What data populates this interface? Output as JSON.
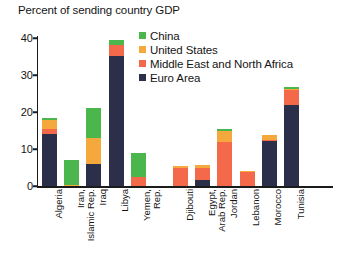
{
  "chart_data": {
    "type": "bar",
    "title": "Percent of sending country GDP",
    "xlabel": "",
    "ylabel": "",
    "ylim": [
      0,
      40
    ],
    "yticks": [
      0,
      10,
      20,
      30,
      40
    ],
    "grid": false,
    "stacked": true,
    "legend_position": "top-center",
    "categories": [
      "Algeria",
      "Iran,\nIslamic Rep.",
      "Iraq",
      "Libya",
      "Yemen,\nRep.",
      "Djibouti",
      "Egypt,\nArab Rep.",
      "Jordan",
      "Lebanon",
      "Morocco",
      "Tunisia"
    ],
    "series": [
      {
        "name": "Euro Area",
        "color": "#2c2f4a",
        "values": [
          14.0,
          0.0,
          6.0,
          35.2,
          0.0,
          0.0,
          1.6,
          0.0,
          0.0,
          12.2,
          21.8
        ]
      },
      {
        "name": "Middle East and North Africa",
        "color": "#f4694a",
        "values": [
          1.3,
          0.0,
          0.0,
          2.8,
          2.4,
          5.0,
          3.4,
          11.8,
          3.9,
          0.3,
          4.2
        ]
      },
      {
        "name": "United States",
        "color": "#f5a93c",
        "values": [
          2.6,
          0.4,
          7.0,
          0.0,
          0.0,
          0.3,
          0.8,
          3.2,
          0.2,
          1.2,
          0.3
        ]
      },
      {
        "name": "China",
        "color": "#4bb64b",
        "values": [
          0.6,
          6.7,
          8.0,
          1.6,
          6.4,
          0.0,
          0.0,
          0.5,
          0.0,
          0.0,
          0.5
        ]
      }
    ],
    "group_gap_after_index": 4
  },
  "colors": {
    "china": "#4bb64b",
    "united_states": "#f5a93c",
    "mena": "#f4694a",
    "euro_area": "#2c2f4a",
    "axis": "#1b1b1b",
    "background": "#ffffff"
  }
}
